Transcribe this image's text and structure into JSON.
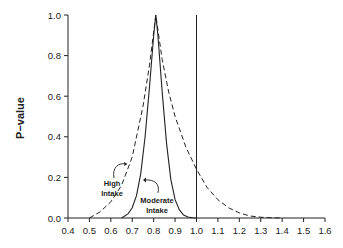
{
  "chart_data": {
    "type": "line",
    "title": "",
    "xlabel": "",
    "ylabel": "P−value",
    "xlim": [
      0.4,
      1.6
    ],
    "ylim": [
      0.0,
      1.0
    ],
    "x_ticks": [
      "0.4",
      "0.5",
      "0.6",
      "0.7",
      "0.8",
      "0.9",
      "1.0",
      "1.1",
      "1.2",
      "1.3",
      "1.4",
      "1.5",
      "1.6"
    ],
    "y_ticks": [
      "0.0",
      "0.2",
      "0.4",
      "0.6",
      "0.8",
      "1.0"
    ],
    "grid": false,
    "reference_line": {
      "x": 1.0,
      "style": "solid vertical"
    },
    "series": [
      {
        "name": "High Intake",
        "style": "dashed",
        "x": [
          0.5,
          0.55,
          0.6,
          0.65,
          0.7,
          0.75,
          0.78,
          0.81,
          0.84,
          0.87,
          0.9,
          0.95,
          1.0,
          1.05,
          1.1,
          1.15,
          1.2,
          1.25,
          1.3,
          1.35,
          1.4
        ],
        "values": [
          0.0,
          0.03,
          0.08,
          0.16,
          0.3,
          0.55,
          0.75,
          1.0,
          0.78,
          0.62,
          0.5,
          0.35,
          0.24,
          0.15,
          0.09,
          0.05,
          0.025,
          0.01,
          0.004,
          0.001,
          0.0
        ]
      },
      {
        "name": "Moderate Intake",
        "style": "solid",
        "x": [
          0.65,
          0.68,
          0.7,
          0.72,
          0.74,
          0.76,
          0.78,
          0.8,
          0.81,
          0.82,
          0.84,
          0.86,
          0.88,
          0.9,
          0.92,
          0.94,
          0.96,
          0.98,
          1.0
        ],
        "values": [
          0.0,
          0.02,
          0.05,
          0.11,
          0.22,
          0.4,
          0.64,
          0.9,
          1.0,
          0.9,
          0.62,
          0.37,
          0.19,
          0.09,
          0.04,
          0.015,
          0.005,
          0.001,
          0.0
        ]
      }
    ],
    "annotations": [
      {
        "text_lines": [
          "High",
          "Intake"
        ],
        "target_series": "High Intake"
      },
      {
        "text_lines": [
          "Moderate",
          "Intake"
        ],
        "target_series": "Moderate Intake"
      }
    ]
  }
}
